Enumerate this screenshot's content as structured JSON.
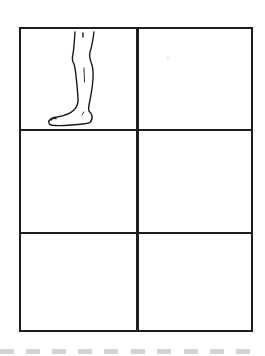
{
  "worksheet": {
    "grid": {
      "rows": 3,
      "columns": 2,
      "line_color": "#1e1e1e",
      "cells": [
        {
          "row": 1,
          "column": 1,
          "content": "leg-and-foot-drawing"
        },
        {
          "row": 1,
          "column": 2,
          "content": ""
        },
        {
          "row": 2,
          "column": 1,
          "content": ""
        },
        {
          "row": 2,
          "column": 2,
          "content": ""
        },
        {
          "row": 3,
          "column": 1,
          "content": ""
        },
        {
          "row": 3,
          "column": 2,
          "content": ""
        }
      ]
    },
    "drawing": {
      "subject": "leg-and-foot-icon",
      "stroke_color": "#1a1a1a"
    },
    "footer": {
      "dash_count": 10,
      "dash_color": "#d4d4d4"
    }
  }
}
